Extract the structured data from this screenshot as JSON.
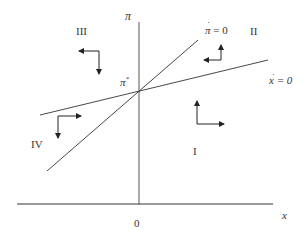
{
  "diagram": {
    "type": "phase-diagram",
    "axes": {
      "y_label": "π",
      "x_label": "x",
      "origin_label": "0"
    },
    "curves": [
      {
        "id": "pi-dot-zero",
        "label_base": "π",
        "label_dot": "·",
        "label_rest": " = 0"
      },
      {
        "id": "x-dot-zero",
        "label_base": "x",
        "label_dot": "·",
        "label_rest": " = 0"
      }
    ],
    "equilibrium": {
      "label": "π",
      "superscript": "*"
    },
    "regions": [
      {
        "id": "I",
        "label": "I",
        "arrows": [
          "up",
          "right"
        ]
      },
      {
        "id": "II",
        "label": "II",
        "arrows": [
          "up",
          "left"
        ]
      },
      {
        "id": "III",
        "label": "III",
        "arrows": [
          "left",
          "down"
        ]
      },
      {
        "id": "IV",
        "label": "IV",
        "arrows": [
          "right",
          "down"
        ]
      }
    ],
    "colors": {
      "line": "#333333",
      "axis": "#555555",
      "background": "#ffffff"
    }
  }
}
